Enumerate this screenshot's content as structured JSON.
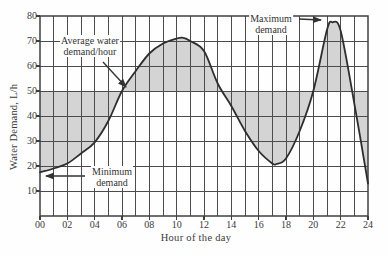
{
  "chart_data": {
    "type": "area",
    "title": "",
    "xlabel": "Hour of the day",
    "ylabel": "Water Demand, L/h",
    "xlim": [
      0,
      24
    ],
    "ylim": [
      0,
      80
    ],
    "x_grid_step_hours": 1,
    "y_grid_step": 10,
    "x_tick_values": [
      0,
      2,
      4,
      6,
      8,
      10,
      12,
      14,
      16,
      18,
      20,
      22,
      24
    ],
    "x_tick_labels": [
      "00",
      "02",
      "04",
      "06",
      "08",
      "10",
      "12",
      "14",
      "16",
      "18",
      "20",
      "22",
      "24"
    ],
    "y_tick_values": [
      10,
      20,
      30,
      40,
      50,
      60,
      70,
      80
    ],
    "y_tick_labels": [
      "10",
      "20",
      "30",
      "40",
      "50",
      "60",
      "70",
      "80"
    ],
    "average_demand_per_hour": 50,
    "curve_points": [
      [
        0,
        17.5
      ],
      [
        1,
        19
      ],
      [
        2,
        21
      ],
      [
        3,
        25
      ],
      [
        4,
        29.5
      ],
      [
        5,
        38
      ],
      [
        6,
        50
      ],
      [
        7,
        58
      ],
      [
        8,
        65
      ],
      [
        9,
        69
      ],
      [
        10,
        71
      ],
      [
        10.5,
        71.3
      ],
      [
        11,
        70
      ],
      [
        12,
        66
      ],
      [
        13,
        53
      ],
      [
        14,
        44
      ],
      [
        15,
        34
      ],
      [
        16,
        26
      ],
      [
        17,
        21
      ],
      [
        17.3,
        20.8
      ],
      [
        18,
        23
      ],
      [
        19,
        34
      ],
      [
        20,
        50
      ],
      [
        21,
        74.5
      ],
      [
        21.4,
        77.5
      ],
      [
        22,
        74
      ],
      [
        23,
        45
      ],
      [
        24,
        13
      ]
    ],
    "shaded_region": "area between demand curve and average line (50 L/h)",
    "legend_position": "none",
    "grid": true,
    "annotations": [
      {
        "id": "average",
        "lines": [
          "Average water",
          "demand/hour"
        ],
        "arrow_px": [
          103,
          62,
          126,
          87
        ]
      },
      {
        "id": "minimum",
        "lines": [
          "Minimum",
          "demand"
        ],
        "arrow_px": [
          85,
          176,
          46,
          176
        ]
      },
      {
        "id": "maximum",
        "lines": [
          "Maximum",
          "demand"
        ],
        "arrow_px": [
          299,
          19,
          321,
          20
        ]
      }
    ],
    "colors": {
      "background": "#fefefe",
      "fill": "#d4d4d4",
      "grid": "#4c4c4c",
      "frame": "#3f3f3f",
      "curve": "#2e2e2e",
      "text": "#3a3a3a",
      "arrow": "#333333"
    }
  },
  "layout": {
    "plot": {
      "left": 40,
      "top": 16,
      "right": 368,
      "bottom": 216
    }
  }
}
